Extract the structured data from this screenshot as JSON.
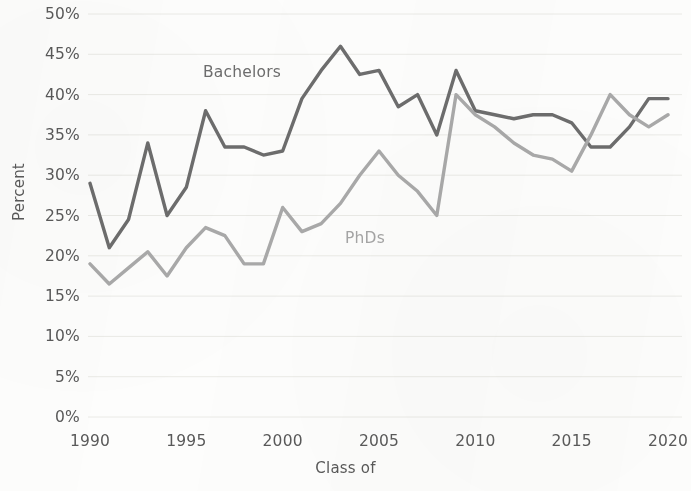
{
  "chart_data": {
    "type": "line",
    "title": "",
    "xlabel": "Class of",
    "ylabel": "Percent",
    "xlim": [
      1990,
      2020
    ],
    "ylim": [
      0,
      50
    ],
    "grid": true,
    "legend_position": "inline-annotation",
    "x_ticks": [
      "1990",
      "1995",
      "2000",
      "2005",
      "2010",
      "2015",
      "2020"
    ],
    "y_ticks": [
      "0%",
      "5%",
      "10%",
      "15%",
      "20%",
      "25%",
      "30%",
      "35%",
      "40%",
      "45%",
      "50%"
    ],
    "x": [
      1990,
      1991,
      1992,
      1993,
      1994,
      1995,
      1996,
      1997,
      1998,
      1999,
      2000,
      2001,
      2002,
      2003,
      2004,
      2005,
      2006,
      2007,
      2008,
      2009,
      2010,
      2011,
      2012,
      2013,
      2014,
      2015,
      2016,
      2017,
      2018,
      2019,
      2020
    ],
    "series": [
      {
        "name": "Bachelors",
        "color": "#6d6d6d",
        "values": [
          29.0,
          21.0,
          24.5,
          34.0,
          25.0,
          28.5,
          38.0,
          33.5,
          33.5,
          32.5,
          33.0,
          39.5,
          43.0,
          46.0,
          42.5,
          43.0,
          38.5,
          40.0,
          35.0,
          43.0,
          38.0,
          37.5,
          37.0,
          37.5,
          37.5,
          36.5,
          33.5,
          33.5,
          36.0,
          39.5,
          39.5
        ]
      },
      {
        "name": "PhDs",
        "color": "#a9a9a9",
        "values": [
          19.0,
          16.5,
          18.5,
          20.5,
          17.5,
          21.0,
          23.5,
          22.5,
          19.0,
          19.0,
          26.0,
          23.0,
          24.0,
          26.5,
          30.0,
          33.0,
          30.0,
          28.0,
          25.0,
          40.0,
          37.5,
          36.0,
          34.0,
          32.5,
          32.0,
          30.5,
          35.0,
          40.0,
          37.5,
          36.0,
          37.5
        ]
      }
    ],
    "annotations": [
      {
        "text": "Bachelors",
        "series": "Bachelors"
      },
      {
        "text": "PhDs",
        "series": "PhDs"
      }
    ]
  },
  "layout": {
    "plot_left": 90,
    "plot_right": 668,
    "y_zero_px": 417,
    "y_max_px": 14,
    "background": "#fdfdfc",
    "gridline_color": "#eaeae6",
    "tick_text_color": "#595959"
  }
}
